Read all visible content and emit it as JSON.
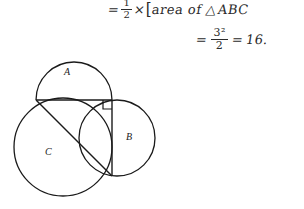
{
  "page": {
    "background_color": "#ffffff",
    "ink_color": "#1a1a1a",
    "handwriting_color": "#2b2b2b",
    "width": 304,
    "height": 209
  },
  "handwriting": {
    "line1": {
      "equals": "=",
      "fraction_numerator": "1",
      "fraction_denominator": "2",
      "times": "×",
      "bracket": "[",
      "phrase": "area of",
      "triangle_symbol": "△",
      "triangle_label": "ABC"
    },
    "line2": {
      "equals": "=",
      "fraction_numerator": "3²",
      "fraction_denominator": "2",
      "equals2": "=",
      "result": "16."
    }
  },
  "figure": {
    "stroke_color": "#1a1a1a",
    "stroke_width": 1.3,
    "fill": "none",
    "circles": [
      {
        "name": "semicircle-a",
        "label": "A",
        "shape": "semicircle",
        "center_x": 74,
        "center_y": 100,
        "radius": 38,
        "label_x": 68,
        "label_y": 75
      },
      {
        "name": "circle-b",
        "label": "B",
        "shape": "circle",
        "center_x": 117,
        "center_y": 138,
        "radius": 38,
        "label_x": 128,
        "label_y": 141
      },
      {
        "name": "circle-c",
        "label": "C",
        "shape": "circle",
        "center_x": 63,
        "center_y": 147,
        "radius": 49,
        "label_x": 47,
        "label_y": 156
      }
    ],
    "triangle": {
      "name": "right-triangle-abc",
      "vertices": [
        {
          "name": "vertex-left",
          "x": 36,
          "y": 100
        },
        {
          "name": "vertex-top-right",
          "x": 112,
          "y": 100
        },
        {
          "name": "vertex-bottom",
          "x": 112,
          "y": 176
        }
      ],
      "right_angle_at": "vertex-top-right",
      "right_angle_marker_size": 9
    }
  }
}
